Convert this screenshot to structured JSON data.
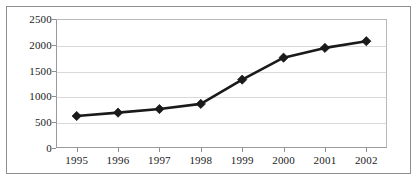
{
  "chart_data": {
    "type": "line",
    "title": "",
    "subtitle": "",
    "xlabel": "",
    "ylabel": "",
    "categories": [
      "1995",
      "1996",
      "1997",
      "1998",
      "1999",
      "2000",
      "2001",
      "2002"
    ],
    "values": [
      620,
      685,
      755,
      855,
      1325,
      1750,
      1940,
      2070
    ],
    "series": [
      {
        "name": "",
        "values": [
          620,
          685,
          755,
          855,
          1325,
          1750,
          1940,
          2070
        ]
      }
    ],
    "ylim": [
      0,
      2500
    ],
    "yticks": [
      0,
      500,
      1000,
      1500,
      2000,
      2500
    ],
    "ytick_labels": [
      "0",
      "500",
      "1000",
      "1500",
      "2000",
      "2500"
    ],
    "xtick_labels": [
      "1995",
      "1996",
      "1997",
      "1998",
      "1999",
      "2000",
      "2001",
      "2002"
    ],
    "grid": "horizontal",
    "legend": "none",
    "marker": "diamond",
    "line_color": "#1a1a1a",
    "marker_color": "#1a1a1a",
    "gridline_color": "#d9d9d9",
    "axis_color": "#8e8e8e",
    "background_color": "#ffffff"
  },
  "axis": {
    "y_labels": [
      "2500",
      "2000",
      "1500",
      "1000",
      "500",
      "0"
    ],
    "x_labels": [
      "1995",
      "1996",
      "1997",
      "1998",
      "1999",
      "2000",
      "2001",
      "2002"
    ]
  }
}
